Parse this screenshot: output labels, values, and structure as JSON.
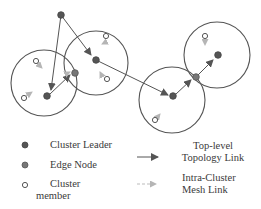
{
  "diagram": {
    "colors": {
      "circle": "#555555",
      "leader": "#555555",
      "edge": "#777777",
      "member_stroke": "#555555",
      "topology_link": "#555555",
      "mesh_link": "#aaaaaa"
    },
    "clusters": [
      {
        "id": "c1",
        "cx": 44,
        "cy": 83,
        "r": 33
      },
      {
        "id": "c2",
        "cx": 96,
        "cy": 63,
        "r": 32
      },
      {
        "id": "c3",
        "cx": 172,
        "cy": 100,
        "r": 33
      },
      {
        "id": "c4",
        "cx": 217,
        "cy": 55,
        "r": 33
      }
    ],
    "nodes": {
      "root": {
        "x": 61,
        "y": 15,
        "type": "leader"
      },
      "leader1": {
        "x": 47,
        "y": 96,
        "type": "leader"
      },
      "edge1": {
        "x": 75,
        "y": 73,
        "type": "edge"
      },
      "leader2": {
        "x": 96,
        "y": 60,
        "type": "leader"
      },
      "leader3": {
        "x": 173,
        "y": 96,
        "type": "leader"
      },
      "edge3": {
        "x": 196,
        "y": 77,
        "type": "edge"
      },
      "leader4": {
        "x": 218,
        "y": 55,
        "type": "leader"
      }
    }
  },
  "legend": {
    "cluster_leader": "Cluster Leader",
    "edge_node": "Edge Node",
    "cluster_member_line1": "Cluster",
    "cluster_member_line2": "member",
    "topology_link_line1": "Top-level",
    "topology_link_line2": "Topology Link",
    "mesh_link_line1": "Intra-Cluster",
    "mesh_link_line2": "Mesh Link"
  }
}
